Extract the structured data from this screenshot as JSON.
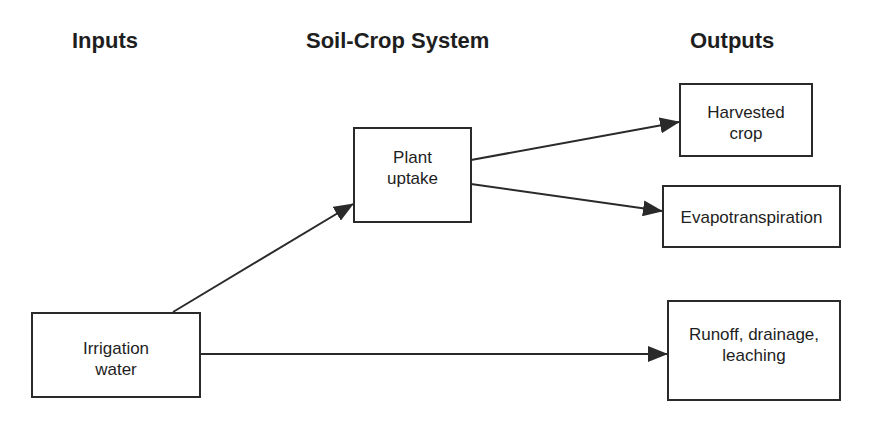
{
  "headings": {
    "inputs": "Inputs",
    "system": "Soil-Crop System",
    "outputs": "Outputs"
  },
  "nodes": {
    "irrigation": {
      "line1": "Irrigation",
      "line2": "water"
    },
    "plant_uptake": {
      "line1": "Plant",
      "line2": "uptake"
    },
    "harvested": {
      "line1": "Harvested",
      "line2": "crop"
    },
    "evapotranspiration": {
      "line1": "Evapotranspiration"
    },
    "runoff": {
      "line1": "Runoff, drainage,",
      "line2": "leaching"
    }
  },
  "edges": [
    {
      "from": "Irrigation water",
      "to": "Plant uptake"
    },
    {
      "from": "Irrigation water",
      "to": "Runoff, drainage, leaching"
    },
    {
      "from": "Plant uptake",
      "to": "Harvested crop"
    },
    {
      "from": "Plant uptake",
      "to": "Evapotranspiration"
    }
  ],
  "colors": {
    "line": "#2a2a2a",
    "background": "#ffffff"
  }
}
